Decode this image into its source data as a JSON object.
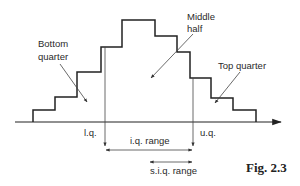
{
  "diagram": {
    "figure_label": "Fig. 2.3",
    "regions": {
      "bottom_quarter": {
        "line1": "Bottom",
        "line2": "quarter"
      },
      "middle_half": {
        "line1": "Middle",
        "line2": "half"
      },
      "top_quarter": "Top quarter"
    },
    "markers": {
      "lower_quartile": "l.q.",
      "upper_quartile": "u.q."
    },
    "ranges": {
      "interquartile": "i.q. range",
      "semi_interquartile": "s.i.q. range"
    },
    "histogram_step_heights": [
      1,
      2,
      4,
      6,
      8,
      7,
      6,
      4,
      2,
      1
    ],
    "colors": {
      "ink": "#222222",
      "background": "#ffffff"
    }
  }
}
